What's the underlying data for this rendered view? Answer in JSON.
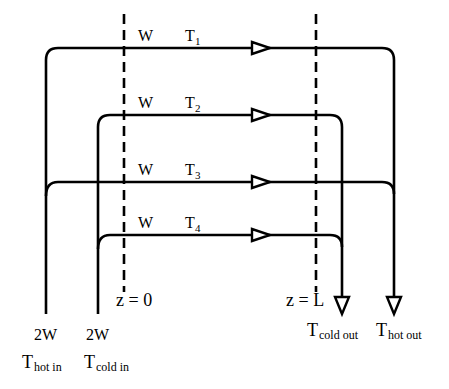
{
  "diagram": {
    "stream_labels": [
      {
        "flow": "W",
        "temp": "T",
        "sub": "1"
      },
      {
        "flow": "W",
        "temp": "T",
        "sub": "2"
      },
      {
        "flow": "W",
        "temp": "T",
        "sub": "3"
      },
      {
        "flow": "W",
        "temp": "T",
        "sub": "4"
      }
    ],
    "boundaries": {
      "left": "z = 0",
      "right": "z = L"
    },
    "inlets": [
      {
        "flow": "2W",
        "temp": "T",
        "sub": "hot in"
      },
      {
        "flow": "2W",
        "temp": "T",
        "sub": "cold in"
      }
    ],
    "outlets": [
      {
        "temp": "T",
        "sub": "cold out"
      },
      {
        "temp": "T",
        "sub": "hot out"
      }
    ],
    "colors": {
      "line": "#000000",
      "background": "#ffffff"
    }
  }
}
